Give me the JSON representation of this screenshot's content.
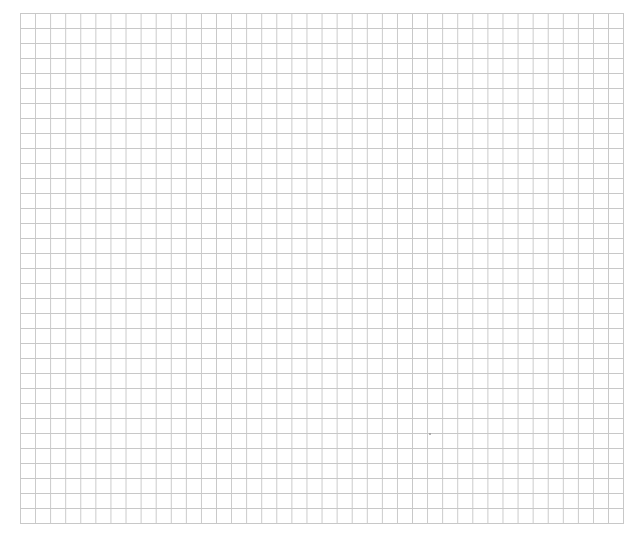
{
  "page": {
    "header_text": "",
    "grid": {
      "columns": 40,
      "rows": 34,
      "cell_size_px": 15,
      "line_color": "#c8c8c8",
      "background_color": "#ffffff"
    },
    "marker": {
      "x": 430,
      "y": 434
    }
  }
}
